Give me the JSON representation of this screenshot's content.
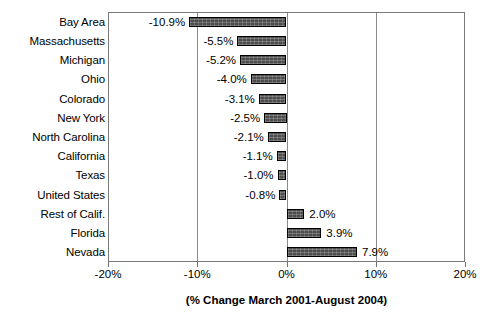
{
  "chart_data": {
    "type": "bar",
    "orientation": "horizontal",
    "title": "",
    "xlabel": "(% Change March 2001-August 2004)",
    "ylabel": "",
    "xlim": [
      -20,
      20
    ],
    "xticks": [
      "-20%",
      "-10%",
      "0%",
      "10%",
      "20%"
    ],
    "xtick_values": [
      -20,
      -10,
      0,
      10,
      20
    ],
    "grid": true,
    "legend": "none",
    "categories": [
      "Bay Area",
      "Massachusetts",
      "Michigan",
      "Ohio",
      "Colorado",
      "New York",
      "North Carolina",
      "California",
      "Texas",
      "United States",
      "Rest of Calif.",
      "Florida",
      "Nevada"
    ],
    "values": [
      -10.9,
      -5.5,
      -5.2,
      -4.0,
      -3.1,
      -2.5,
      -2.1,
      -1.1,
      -1.0,
      -0.8,
      2.0,
      3.9,
      7.9
    ],
    "value_labels": [
      "-10.9%",
      "-5.5%",
      "-5.2%",
      "-4.0%",
      "-3.1%",
      "-2.5%",
      "-2.1%",
      "-1.1%",
      "-1.0%",
      "-0.8%",
      "2.0%",
      "3.9%",
      "7.9%"
    ],
    "bar_color": "#4d4d4d",
    "bar_border_color": "#000000",
    "axis_color": "#7a7a7a"
  }
}
